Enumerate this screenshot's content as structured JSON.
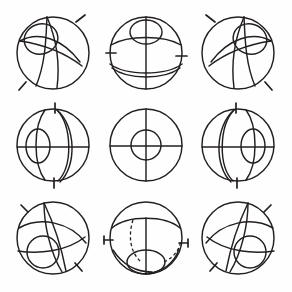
{
  "figure": {
    "background_color": "#fefefe",
    "line_color": "#231f20",
    "canvas": {
      "width": 292,
      "height": 292
    },
    "grid": {
      "rows": 3,
      "columns": 3,
      "cell_count": 9
    }
  },
  "layout": {
    "column_centers_x": [
      53,
      146,
      238
    ],
    "row_centers_y": [
      53,
      145,
      238
    ],
    "sphere_radius": 36
  },
  "cells": [
    {
      "id": "cell-r1c1",
      "row": 1,
      "column": 1,
      "center": {
        "x": 53,
        "y": 53
      },
      "radius": 36,
      "small_feature": "ellipse-upper-left",
      "line_style": "solid",
      "tick_positions": [
        "upper-right",
        "lower-left"
      ],
      "tick_count": 2
    },
    {
      "id": "cell-r1c2",
      "row": 1,
      "column": 2,
      "center": {
        "x": 146,
        "y": 53
      },
      "radius": 36,
      "small_feature": "ellipse-top",
      "line_style": "solid",
      "tick_positions": [
        "left",
        "right"
      ],
      "tick_count": 2
    },
    {
      "id": "cell-r1c3",
      "row": 1,
      "column": 3,
      "center": {
        "x": 238,
        "y": 53
      },
      "radius": 36,
      "small_feature": "ellipse-upper-right",
      "line_style": "solid",
      "tick_positions": [
        "upper-left",
        "lower-right"
      ],
      "tick_count": 2
    },
    {
      "id": "cell-r2c1",
      "row": 2,
      "column": 1,
      "center": {
        "x": 53,
        "y": 145
      },
      "radius": 36,
      "small_feature": "ellipse-left",
      "line_style": "solid",
      "tick_positions": [
        "top",
        "bottom"
      ],
      "tick_count": 2
    },
    {
      "id": "cell-r2c2",
      "row": 2,
      "column": 2,
      "center": {
        "x": 146,
        "y": 145
      },
      "radius": 36,
      "small_feature": "concentric-circle",
      "line_style": "solid",
      "tick_positions": [],
      "tick_count": 0
    },
    {
      "id": "cell-r2c3",
      "row": 2,
      "column": 3,
      "center": {
        "x": 238,
        "y": 145
      },
      "radius": 36,
      "small_feature": "ellipse-right",
      "line_style": "solid",
      "tick_positions": [
        "top",
        "bottom"
      ],
      "tick_count": 2
    },
    {
      "id": "cell-r3c1",
      "row": 3,
      "column": 1,
      "center": {
        "x": 53,
        "y": 238
      },
      "radius": 36,
      "small_feature": "ellipse-lower-left",
      "line_style": "solid",
      "tick_positions": [
        "upper-left",
        "lower-right"
      ],
      "tick_count": 2
    },
    {
      "id": "cell-r3c2",
      "row": 3,
      "column": 2,
      "center": {
        "x": 146,
        "y": 238
      },
      "radius": 36,
      "small_feature": "ellipse-bottom",
      "line_style": "solid-and-dashed",
      "tick_positions": [
        "left",
        "right"
      ],
      "tick_count": 2
    },
    {
      "id": "cell-r3c3",
      "row": 3,
      "column": 3,
      "center": {
        "x": 238,
        "y": 238
      },
      "radius": 36,
      "small_feature": "ellipse-lower-right",
      "line_style": "solid",
      "tick_positions": [
        "upper-right",
        "lower-left"
      ],
      "tick_count": 2
    }
  ]
}
